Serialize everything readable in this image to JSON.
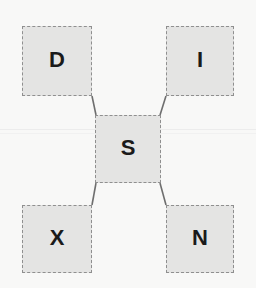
{
  "diagram": {
    "background_color": "#f8f8f7",
    "node_fill_color": "#e4e4e3",
    "node_border_color": "#8f8f8f",
    "edge_color": "#6e6e6e",
    "label_color": "#1a1a1a",
    "nodes": [
      {
        "id": "d",
        "label": "D",
        "role": "corner-top-left"
      },
      {
        "id": "i",
        "label": "I",
        "role": "corner-top-right"
      },
      {
        "id": "s",
        "label": "S",
        "role": "center"
      },
      {
        "id": "x",
        "label": "X",
        "role": "corner-bottom-left"
      },
      {
        "id": "n",
        "label": "N",
        "role": "corner-bottom-right"
      }
    ],
    "edges": [
      {
        "from": "d",
        "to": "s",
        "x1": 92,
        "y1": 96,
        "x2": 96,
        "y2": 115
      },
      {
        "from": "i",
        "to": "s",
        "x1": 166,
        "y1": 96,
        "x2": 160,
        "y2": 115
      },
      {
        "from": "x",
        "to": "s",
        "x1": 92,
        "y1": 205,
        "x2": 96,
        "y2": 183
      },
      {
        "from": "n",
        "to": "s",
        "x1": 166,
        "y1": 205,
        "x2": 160,
        "y2": 183
      }
    ]
  }
}
